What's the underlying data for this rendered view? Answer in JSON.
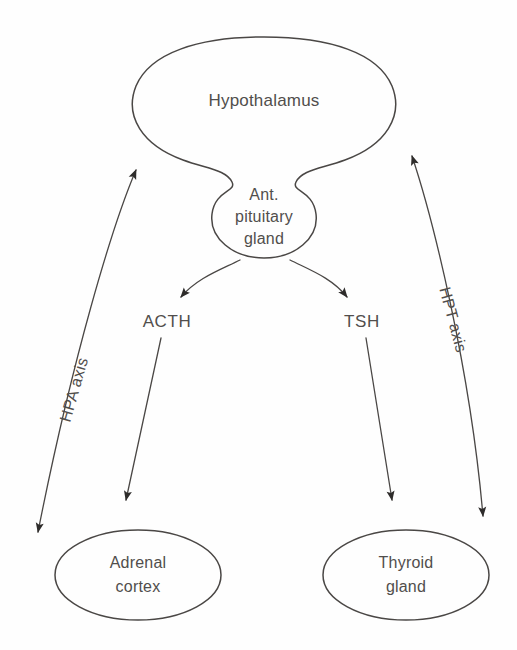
{
  "diagram": {
    "type": "biological-flow-diagram",
    "background_color": "#fefefe",
    "stroke_color": "#4a4745",
    "text_color": "#514e4c",
    "nodes": {
      "hypothalamus": {
        "label": "Hypothalamus",
        "shape": "balloon-ellipse"
      },
      "pituitary": {
        "line1": "Ant.",
        "line2": "pituitary",
        "line3": "gland",
        "shape": "bulb"
      },
      "adrenal": {
        "line1": "Adrenal",
        "line2": "cortex",
        "shape": "ellipse"
      },
      "thyroid": {
        "line1": "Thyroid",
        "line2": "gland",
        "shape": "ellipse"
      }
    },
    "hormones": {
      "left": "ACTH",
      "right": "TSH"
    },
    "axes": {
      "left": "HPA axis",
      "right": "HPT axis"
    }
  }
}
